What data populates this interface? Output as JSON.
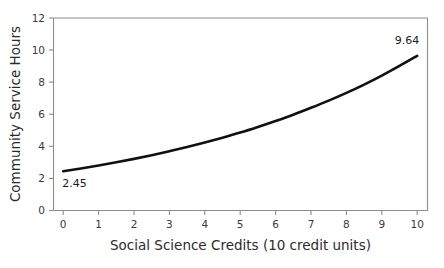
{
  "chart_data": {
    "type": "line",
    "title": "",
    "xlabel": "Social Science Credits (10 credit units)",
    "ylabel": "Community Service Hours",
    "xlim": [
      0,
      10
    ],
    "ylim": [
      0,
      12
    ],
    "grid": false,
    "legend": false,
    "x_ticks": [
      "0",
      "1",
      "2",
      "3",
      "4",
      "5",
      "6",
      "7",
      "8",
      "9",
      "10"
    ],
    "y_ticks": [
      "0",
      "2",
      "4",
      "6",
      "8",
      "10",
      "12"
    ],
    "series": [
      {
        "name": "Community Service Hours",
        "color": "#111111",
        "x": [
          0,
          0.5,
          1,
          1.5,
          2,
          2.5,
          3,
          3.5,
          4,
          4.5,
          5,
          5.5,
          6,
          6.5,
          7,
          7.5,
          8,
          8.5,
          9,
          9.5,
          10
        ],
        "values": [
          2.45,
          2.62,
          2.81,
          3.01,
          3.22,
          3.45,
          3.7,
          3.96,
          4.24,
          4.54,
          4.86,
          5.21,
          5.58,
          5.97,
          6.4,
          6.85,
          7.33,
          7.85,
          8.41,
          9.01,
          9.64
        ]
      }
    ],
    "annotations": [
      {
        "text": "2.45",
        "x": 0,
        "y": 2.45,
        "position": "below-right"
      },
      {
        "text": "9.64",
        "x": 10,
        "y": 9.64,
        "position": "above-left"
      }
    ]
  },
  "axes": {
    "x_title": "Social Science Credits (10 credit units)",
    "y_title": "Community Service Hours"
  },
  "labels": {
    "start_value": "2.45",
    "end_value": "9.64"
  },
  "colors": {
    "curve": "#111111",
    "frame": "#8d8d8d",
    "text": "#2b2b2b",
    "background": "#ffffff"
  }
}
